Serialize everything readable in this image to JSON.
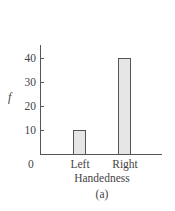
{
  "chart_data": {
    "type": "bar",
    "title": "",
    "xlabel": "Handedness",
    "ylabel": "f",
    "categories": [
      "Left",
      "Right"
    ],
    "values": [
      10,
      40
    ],
    "ylim": [
      0,
      45
    ],
    "yticks": [
      10,
      20,
      30,
      40
    ],
    "origin_label": "0",
    "caption": "(a)",
    "grid": false,
    "legend": null,
    "bar_fill": "#e6e6e6",
    "bar_stroke": "#555555"
  },
  "labels": {
    "y_title": "f",
    "x_title": "Handedness",
    "caption": "(a)",
    "zero": "0",
    "ticks": [
      "10",
      "20",
      "30",
      "40"
    ],
    "categories": [
      "Left",
      "Right"
    ]
  }
}
